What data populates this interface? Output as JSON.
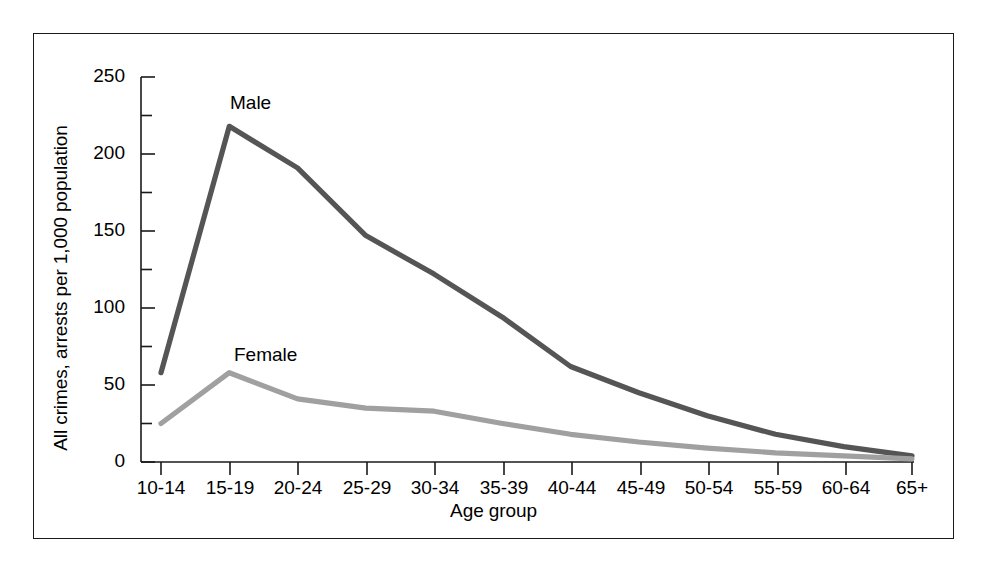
{
  "figure": {
    "background_color": "#ffffff",
    "frame_color": "#1a1a1a"
  },
  "chart_data": {
    "type": "line",
    "title": "",
    "xlabel": "Age group",
    "ylabel": "All crimes, arrests per 1,000 population",
    "categories": [
      "10-14",
      "15-19",
      "20-24",
      "25-29",
      "30-34",
      "35-39",
      "40-44",
      "45-49",
      "50-54",
      "55-59",
      "60-64",
      "65+"
    ],
    "series": [
      {
        "name": "Male",
        "color": "#555555",
        "values": [
          58,
          218,
          191,
          147,
          122,
          94,
          62,
          45,
          30,
          18,
          10,
          4
        ]
      },
      {
        "name": "Female",
        "color": "#a0a0a0",
        "values": [
          25,
          58,
          41,
          35,
          33,
          25,
          18,
          13,
          9,
          6,
          4,
          2
        ]
      }
    ],
    "ylim": [
      0,
      250
    ],
    "yticks": [
      0,
      50,
      100,
      150,
      200,
      250
    ],
    "ytick_labels": [
      "0",
      "50",
      "100",
      "150",
      "200",
      "250"
    ],
    "yminor_ticks": [
      25,
      75,
      125,
      175,
      225
    ],
    "grid": false,
    "legend_position": "inline-annotations",
    "annotations": [
      {
        "text": "Male",
        "category": "15-19",
        "value": 240
      },
      {
        "text": "Female",
        "category": "20-24",
        "value": 72
      }
    ]
  }
}
